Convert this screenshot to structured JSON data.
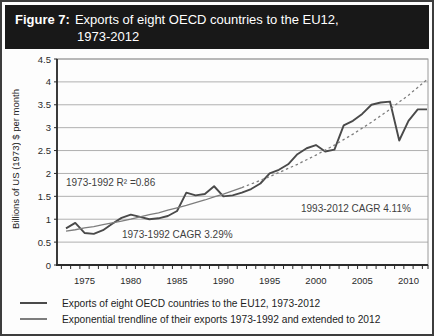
{
  "header": {
    "label": "Figure 7:",
    "title_line1": "Exports of eight OECD countries to the EU12,",
    "title_line2": "1973-2012"
  },
  "chart_data": {
    "type": "line",
    "ylabel": "Billions of US (1973) $ per month",
    "xlabel": "",
    "ylim": [
      0,
      4.5
    ],
    "grid": "horizontal",
    "legend_position": "bottom",
    "x": [
      1973,
      1974,
      1975,
      1976,
      1977,
      1978,
      1979,
      1980,
      1981,
      1982,
      1983,
      1984,
      1985,
      1986,
      1987,
      1988,
      1989,
      1990,
      1991,
      1992,
      1993,
      1994,
      1995,
      1996,
      1997,
      1998,
      1999,
      2000,
      2001,
      2002,
      2003,
      2004,
      2005,
      2006,
      2007,
      2008,
      2009,
      2010,
      2011,
      2012
    ],
    "xticks": [
      1975,
      1980,
      1985,
      1990,
      1995,
      2000,
      2005,
      2010
    ],
    "yticks": [
      {
        "v": 0,
        "label": "0"
      },
      {
        "v": 0.5,
        "label": "0.5"
      },
      {
        "v": 1,
        "label": "1"
      },
      {
        "v": 1.5,
        "label": "1.5"
      },
      {
        "v": 2,
        "label": "2"
      },
      {
        "v": 2.5,
        "label": "2.5"
      },
      {
        "v": 3,
        "label": "3"
      },
      {
        "v": 3.5,
        "label": "3.5"
      },
      {
        "v": 4,
        "label": "4"
      },
      {
        "v": 4.5,
        "label": "4.5"
      }
    ],
    "series": [
      {
        "name": "Exports of eight OECD countries to the EU12, 1973-2012",
        "color": "#4a4a4a",
        "width": 1.9,
        "values": [
          0.8,
          0.92,
          0.7,
          0.68,
          0.76,
          0.9,
          1.03,
          1.1,
          1.05,
          1.0,
          1.02,
          1.07,
          1.18,
          1.58,
          1.52,
          1.55,
          1.72,
          1.5,
          1.52,
          1.58,
          1.66,
          1.78,
          2.0,
          2.08,
          2.2,
          2.42,
          2.55,
          2.62,
          2.48,
          2.52,
          3.05,
          3.15,
          3.3,
          3.5,
          3.55,
          3.57,
          2.72,
          3.15,
          3.4,
          3.4
        ]
      },
      {
        "name": "Exponential trendline of their exports 1973-1992 and extended to 2012",
        "color": "#7d7d7d",
        "width": 1.3,
        "dashed_from_year": 1992,
        "values": [
          0.74,
          0.77,
          0.81,
          0.84,
          0.88,
          0.92,
          0.96,
          1.0,
          1.05,
          1.1,
          1.14,
          1.2,
          1.25,
          1.3,
          1.36,
          1.42,
          1.49,
          1.55,
          1.62,
          1.69,
          1.77,
          1.85,
          1.93,
          2.02,
          2.11,
          2.2,
          2.3,
          2.4,
          2.51,
          2.62,
          2.74,
          2.86,
          2.99,
          3.12,
          3.26,
          3.4,
          3.56,
          3.71,
          3.88,
          4.05
        ]
      }
    ],
    "annotations": [
      {
        "text": "1973-1992 R² =0.86"
      },
      {
        "text": "1973-1992 CAGR 3.29%"
      },
      {
        "text": "1993-2012 CAGR 4.11%"
      }
    ],
    "colors": {
      "grid": "#b0b0b0",
      "axis": "#2b2b2b",
      "plot_border": "#9a9a9a",
      "header_bg": "#181818"
    }
  },
  "legend": [
    {
      "label": "Exports of eight OECD countries to the EU12, 1973-2012"
    },
    {
      "label": "Exponential trendline of their exports 1973-1992 and extended to 2012"
    }
  ]
}
